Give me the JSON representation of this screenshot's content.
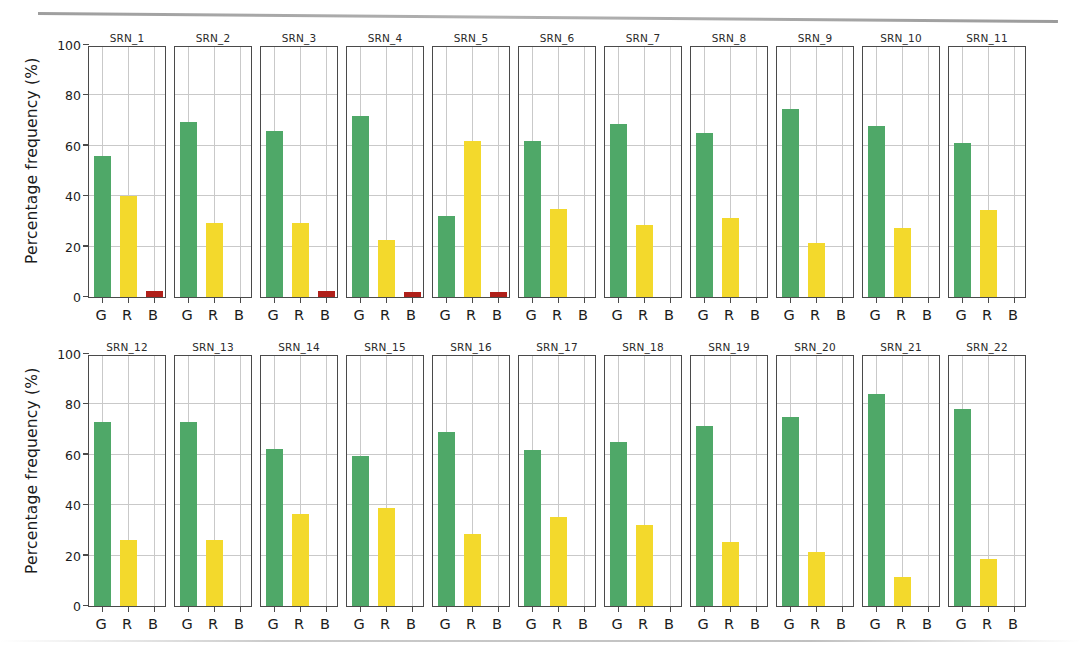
{
  "figure": {
    "ylabel": "Percentage frequency (%)",
    "yticks": [
      "0",
      "20",
      "40",
      "60",
      "80",
      "100"
    ],
    "xticks": [
      "G",
      "R",
      "B"
    ],
    "colors": {
      "G": "#4fa868",
      "R": "#f3d92c",
      "B": "#b0201a",
      "axis": "#4a4a4a",
      "grid": "#c9c9c9",
      "background": "#ffffff"
    }
  },
  "chart_data": {
    "type": "bar",
    "title": "",
    "xlabel": "",
    "ylabel": "Percentage frequency (%)",
    "ylim": [
      0,
      100
    ],
    "yticks": [
      0,
      20,
      40,
      60,
      80,
      100
    ],
    "grid": true,
    "legend": "none",
    "categories": [
      "G",
      "R",
      "B"
    ],
    "layout": {
      "rows": 2,
      "cols": 11,
      "shared_y": true
    },
    "panels": [
      {
        "title": "SRN_1",
        "values": [
          56.0,
          40.0,
          2.5
        ]
      },
      {
        "title": "SRN_2",
        "values": [
          69.5,
          29.5,
          0.0
        ]
      },
      {
        "title": "SRN_3",
        "values": [
          66.0,
          29.5,
          2.5
        ]
      },
      {
        "title": "SRN_4",
        "values": [
          72.0,
          22.5,
          2.0
        ]
      },
      {
        "title": "SRN_5",
        "values": [
          32.0,
          62.0,
          2.0
        ]
      },
      {
        "title": "SRN_6",
        "values": [
          62.0,
          35.0,
          0.0
        ]
      },
      {
        "title": "SRN_7",
        "values": [
          68.5,
          28.5,
          0.0
        ]
      },
      {
        "title": "SRN_8",
        "values": [
          65.0,
          31.5,
          0.0
        ]
      },
      {
        "title": "SRN_9",
        "values": [
          74.5,
          21.5,
          0.0
        ]
      },
      {
        "title": "SRN_10",
        "values": [
          68.0,
          27.5,
          0.0
        ]
      },
      {
        "title": "SRN_11",
        "values": [
          61.0,
          34.5,
          0.0
        ]
      },
      {
        "title": "SRN_12",
        "values": [
          73.0,
          26.0,
          0.0
        ]
      },
      {
        "title": "SRN_13",
        "values": [
          73.0,
          26.0,
          0.0
        ]
      },
      {
        "title": "SRN_14",
        "values": [
          62.5,
          36.5,
          0.0
        ]
      },
      {
        "title": "SRN_15",
        "values": [
          59.5,
          39.0,
          0.0
        ]
      },
      {
        "title": "SRN_16",
        "values": [
          69.0,
          28.5,
          0.0
        ]
      },
      {
        "title": "SRN_17",
        "values": [
          62.0,
          35.5,
          0.0
        ]
      },
      {
        "title": "SRN_18",
        "values": [
          65.0,
          32.0,
          0.0
        ]
      },
      {
        "title": "SRN_19",
        "values": [
          71.5,
          25.5,
          0.0
        ]
      },
      {
        "title": "SRN_20",
        "values": [
          75.0,
          21.5,
          0.0
        ]
      },
      {
        "title": "SRN_21",
        "values": [
          84.0,
          11.5,
          0.0
        ]
      },
      {
        "title": "SRN_22",
        "values": [
          78.0,
          18.5,
          0.0
        ]
      }
    ]
  }
}
